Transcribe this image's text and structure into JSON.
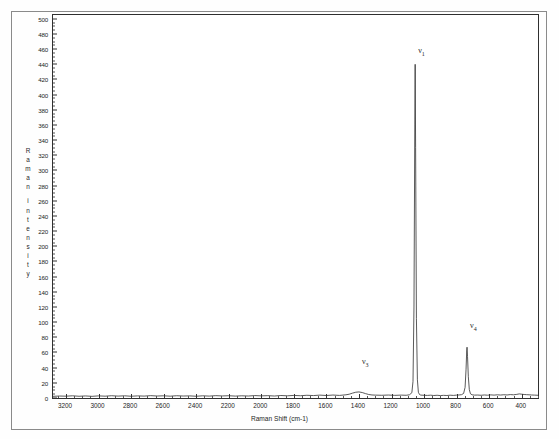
{
  "document": {
    "sample_title": "STRONTIUM NITRATE",
    "table": {
      "code": "67R",
      "headers": [
        "Frequency",
        "R I"
      ],
      "rows": [
        {
          "frequency": "1054.7",
          "ri": "100.0"
        },
        {
          "frequency": "736.0",
          "ri": "14.5"
        }
      ]
    },
    "y_axis_caption": "Raman intensity"
  },
  "chart_data": {
    "type": "line",
    "title": "STRONTIUM NITRATE",
    "xlabel": "Raman Shift (cm-1)",
    "ylabel": "Raman intensity",
    "xlim": [
      3280,
      300
    ],
    "ylim": [
      0,
      505
    ],
    "x_reversed": true,
    "grid": false,
    "legend": "none",
    "x_ticks": [
      3200,
      3000,
      2800,
      2600,
      2400,
      2200,
      2000,
      1800,
      1600,
      1400,
      1200,
      1000,
      800,
      600,
      400
    ],
    "x_minor_step": 50,
    "y_ticks": [
      0,
      20,
      40,
      60,
      80,
      100,
      120,
      140,
      160,
      180,
      200,
      220,
      240,
      260,
      280,
      300,
      320,
      340,
      360,
      380,
      400,
      420,
      440,
      460,
      480,
      500
    ],
    "y_minor_step": 5,
    "annotations": [
      {
        "label": "ν",
        "sub": "1",
        "x": 1054.7,
        "y": 455
      },
      {
        "label": "ν",
        "sub": "3",
        "x": 1400.0,
        "y": 45
      },
      {
        "label": "ν",
        "sub": "4",
        "x": 736.0,
        "y": 92
      }
    ],
    "peaks": [
      {
        "name": "nu1",
        "shift": 1054.7,
        "intensity": 440,
        "relative_intensity": 100.0,
        "width": 9
      },
      {
        "name": "nu4",
        "shift": 736.0,
        "intensity": 67,
        "relative_intensity": 14.5,
        "width": 9
      },
      {
        "name": "nu3",
        "shift": 1400.0,
        "intensity": 8,
        "relative_intensity": 1.8,
        "width": 45
      }
    ],
    "baseline": 2.5,
    "series": [
      {
        "name": "Raman spectrum",
        "color": "#303030",
        "points": [
          [
            3280,
            2.2
          ],
          [
            3240,
            2.6
          ],
          [
            3200,
            2.4
          ],
          [
            3160,
            2.9
          ],
          [
            3120,
            2.3
          ],
          [
            3080,
            2.7
          ],
          [
            3040,
            2.2
          ],
          [
            3000,
            2.8
          ],
          [
            2960,
            2.4
          ],
          [
            2920,
            3.0
          ],
          [
            2880,
            2.5
          ],
          [
            2840,
            2.9
          ],
          [
            2800,
            2.3
          ],
          [
            2760,
            2.8
          ],
          [
            2720,
            2.5
          ],
          [
            2680,
            3.1
          ],
          [
            2640,
            2.6
          ],
          [
            2600,
            2.9
          ],
          [
            2560,
            2.4
          ],
          [
            2520,
            3.0
          ],
          [
            2480,
            2.6
          ],
          [
            2440,
            2.8
          ],
          [
            2400,
            2.3
          ],
          [
            2360,
            2.9
          ],
          [
            2320,
            2.5
          ],
          [
            2280,
            3.1
          ],
          [
            2240,
            2.7
          ],
          [
            2200,
            3.0
          ],
          [
            2160,
            2.5
          ],
          [
            2120,
            2.9
          ],
          [
            2080,
            2.6
          ],
          [
            2040,
            3.2
          ],
          [
            2000,
            2.8
          ],
          [
            1960,
            3.1
          ],
          [
            1920,
            2.6
          ],
          [
            1880,
            3.3
          ],
          [
            1840,
            2.9
          ],
          [
            1800,
            3.4
          ],
          [
            1760,
            3.0
          ],
          [
            1720,
            3.6
          ],
          [
            1680,
            3.2
          ],
          [
            1640,
            3.8
          ],
          [
            1600,
            3.3
          ],
          [
            1560,
            3.9
          ],
          [
            1520,
            3.4
          ],
          [
            1480,
            4.2
          ],
          [
            1460,
            5.0
          ],
          [
            1440,
            6.4
          ],
          [
            1420,
            7.6
          ],
          [
            1400,
            8.0
          ],
          [
            1380,
            7.2
          ],
          [
            1360,
            5.8
          ],
          [
            1340,
            4.6
          ],
          [
            1320,
            4.0
          ],
          [
            1300,
            3.8
          ],
          [
            1260,
            3.6
          ],
          [
            1220,
            3.9
          ],
          [
            1180,
            3.5
          ],
          [
            1140,
            3.8
          ],
          [
            1110,
            3.6
          ],
          [
            1090,
            4.2
          ],
          [
            1075,
            7.0
          ],
          [
            1068,
            22
          ],
          [
            1062,
            120
          ],
          [
            1057,
            360
          ],
          [
            1054.7,
            440
          ],
          [
            1052,
            330
          ],
          [
            1047,
            105
          ],
          [
            1041,
            24
          ],
          [
            1035,
            7.5
          ],
          [
            1028,
            4.6
          ],
          [
            1020,
            3.8
          ],
          [
            1000,
            3.6
          ],
          [
            980,
            3.4
          ],
          [
            960,
            3.7
          ],
          [
            940,
            3.3
          ],
          [
            920,
            3.6
          ],
          [
            900,
            3.2
          ],
          [
            880,
            3.5
          ],
          [
            860,
            3.3
          ],
          [
            840,
            3.7
          ],
          [
            820,
            3.4
          ],
          [
            800,
            3.8
          ],
          [
            785,
            4.0
          ],
          [
            770,
            4.4
          ],
          [
            757,
            6.0
          ],
          [
            748,
            14
          ],
          [
            742,
            38
          ],
          [
            738,
            62
          ],
          [
            736,
            67
          ],
          [
            733,
            55
          ],
          [
            728,
            28
          ],
          [
            722,
            11
          ],
          [
            715,
            5.6
          ],
          [
            705,
            4.2
          ],
          [
            690,
            3.8
          ],
          [
            670,
            3.9
          ],
          [
            650,
            3.6
          ],
          [
            630,
            4.0
          ],
          [
            610,
            3.7
          ],
          [
            590,
            4.1
          ],
          [
            570,
            3.8
          ],
          [
            550,
            4.2
          ],
          [
            530,
            3.9
          ],
          [
            510,
            4.3
          ],
          [
            490,
            4.0
          ],
          [
            470,
            4.5
          ],
          [
            450,
            4.2
          ],
          [
            430,
            4.8
          ],
          [
            415,
            5.4
          ],
          [
            400,
            5.0
          ],
          [
            385,
            4.6
          ],
          [
            370,
            4.4
          ],
          [
            355,
            4.2
          ],
          [
            340,
            4.0
          ],
          [
            320,
            3.8
          ],
          [
            300,
            3.6
          ]
        ]
      }
    ]
  }
}
